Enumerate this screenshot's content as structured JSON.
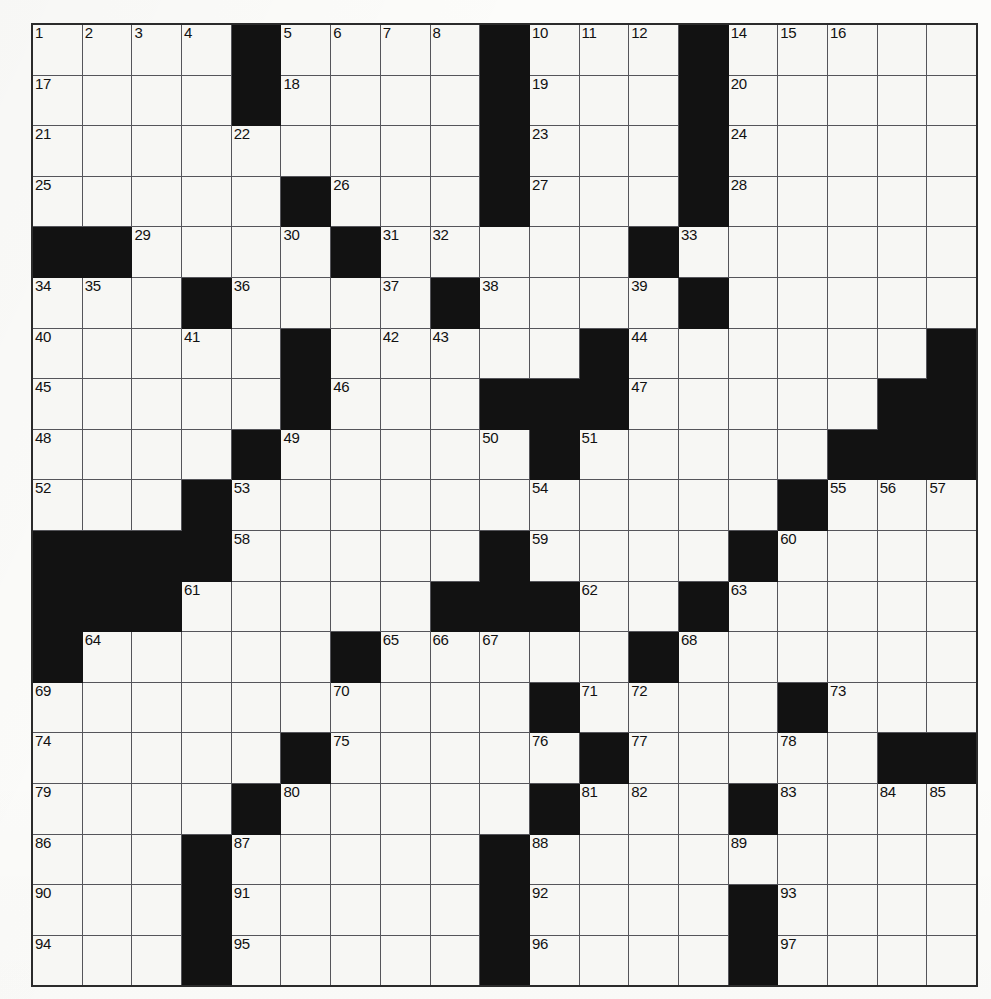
{
  "puzzle": {
    "kind": "crossword-grid",
    "rows": 19,
    "cols": 19,
    "colors": {
      "block": "#121212",
      "cell": "#f7f7f4",
      "gridline": "#55555a",
      "border": "#2b2b2b",
      "number_text": "#111111",
      "paper": "#fcfcfa"
    },
    "blocks": [
      [
        0,
        4
      ],
      [
        0,
        9
      ],
      [
        0,
        13
      ],
      [
        1,
        4
      ],
      [
        1,
        9
      ],
      [
        1,
        13
      ],
      [
        2,
        9
      ],
      [
        2,
        13
      ],
      [
        3,
        5
      ],
      [
        3,
        9
      ],
      [
        3,
        13
      ],
      [
        4,
        0
      ],
      [
        4,
        1
      ],
      [
        4,
        6
      ],
      [
        4,
        12
      ],
      [
        5,
        3
      ],
      [
        5,
        8
      ],
      [
        5,
        13
      ],
      [
        6,
        5
      ],
      [
        6,
        11
      ],
      [
        6,
        18
      ],
      [
        7,
        5
      ],
      [
        7,
        9
      ],
      [
        7,
        10
      ],
      [
        7,
        11
      ],
      [
        7,
        17
      ],
      [
        7,
        18
      ],
      [
        8,
        4
      ],
      [
        8,
        10
      ],
      [
        8,
        16
      ],
      [
        8,
        17
      ],
      [
        8,
        18
      ],
      [
        9,
        3
      ],
      [
        9,
        15
      ],
      [
        10,
        0
      ],
      [
        10,
        1
      ],
      [
        10,
        2
      ],
      [
        10,
        3
      ],
      [
        10,
        9
      ],
      [
        10,
        14
      ],
      [
        11,
        0
      ],
      [
        11,
        1
      ],
      [
        11,
        2
      ],
      [
        11,
        8
      ],
      [
        11,
        9
      ],
      [
        11,
        10
      ],
      [
        11,
        13
      ],
      [
        12,
        0
      ],
      [
        12,
        6
      ],
      [
        12,
        12
      ],
      [
        13,
        10
      ],
      [
        13,
        15
      ],
      [
        14,
        5
      ],
      [
        14,
        11
      ],
      [
        14,
        17
      ],
      [
        14,
        18
      ],
      [
        15,
        4
      ],
      [
        15,
        10
      ],
      [
        15,
        14
      ],
      [
        16,
        3
      ],
      [
        16,
        9
      ],
      [
        17,
        3
      ],
      [
        17,
        9
      ],
      [
        17,
        14
      ],
      [
        18,
        3
      ],
      [
        18,
        9
      ],
      [
        18,
        14
      ]
    ],
    "numbers": [
      {
        "r": 0,
        "c": 0,
        "n": "1"
      },
      {
        "r": 0,
        "c": 1,
        "n": "2"
      },
      {
        "r": 0,
        "c": 2,
        "n": "3"
      },
      {
        "r": 0,
        "c": 3,
        "n": "4"
      },
      {
        "r": 0,
        "c": 5,
        "n": "5"
      },
      {
        "r": 0,
        "c": 6,
        "n": "6"
      },
      {
        "r": 0,
        "c": 7,
        "n": "7"
      },
      {
        "r": 0,
        "c": 8,
        "n": "8"
      },
      {
        "r": 0,
        "c": 9,
        "n": "9"
      },
      {
        "r": 0,
        "c": 10,
        "n": "10"
      },
      {
        "r": 0,
        "c": 11,
        "n": "11"
      },
      {
        "r": 0,
        "c": 12,
        "n": "12"
      },
      {
        "r": 0,
        "c": 13,
        "n": "13"
      },
      {
        "r": 0,
        "c": 14,
        "n": "14"
      },
      {
        "r": 0,
        "c": 15,
        "n": "15"
      },
      {
        "r": 0,
        "c": 16,
        "n": "16"
      },
      {
        "r": 1,
        "c": 0,
        "n": "17"
      },
      {
        "r": 1,
        "c": 5,
        "n": "18"
      },
      {
        "r": 1,
        "c": 10,
        "n": "19"
      },
      {
        "r": 1,
        "c": 14,
        "n": "20"
      },
      {
        "r": 2,
        "c": 0,
        "n": "21"
      },
      {
        "r": 2,
        "c": 4,
        "n": "22"
      },
      {
        "r": 2,
        "c": 10,
        "n": "23"
      },
      {
        "r": 2,
        "c": 14,
        "n": "24"
      },
      {
        "r": 3,
        "c": 0,
        "n": "25"
      },
      {
        "r": 3,
        "c": 6,
        "n": "26"
      },
      {
        "r": 3,
        "c": 10,
        "n": "27"
      },
      {
        "r": 3,
        "c": 14,
        "n": "28"
      },
      {
        "r": 4,
        "c": 2,
        "n": "29"
      },
      {
        "r": 4,
        "c": 5,
        "n": "30"
      },
      {
        "r": 4,
        "c": 7,
        "n": "31"
      },
      {
        "r": 4,
        "c": 8,
        "n": "32"
      },
      {
        "r": 4,
        "c": 13,
        "n": "33"
      },
      {
        "r": 5,
        "c": 0,
        "n": "34"
      },
      {
        "r": 5,
        "c": 1,
        "n": "35"
      },
      {
        "r": 5,
        "c": 4,
        "n": "36"
      },
      {
        "r": 5,
        "c": 7,
        "n": "37"
      },
      {
        "r": 5,
        "c": 9,
        "n": "38"
      },
      {
        "r": 5,
        "c": 12,
        "n": "39"
      },
      {
        "r": 6,
        "c": 0,
        "n": "40"
      },
      {
        "r": 6,
        "c": 3,
        "n": "41"
      },
      {
        "r": 6,
        "c": 7,
        "n": "42"
      },
      {
        "r": 6,
        "c": 8,
        "n": "43"
      },
      {
        "r": 6,
        "c": 12,
        "n": "44"
      },
      {
        "r": 7,
        "c": 0,
        "n": "45"
      },
      {
        "r": 7,
        "c": 6,
        "n": "46"
      },
      {
        "r": 7,
        "c": 12,
        "n": "47"
      },
      {
        "r": 8,
        "c": 0,
        "n": "48"
      },
      {
        "r": 8,
        "c": 5,
        "n": "49"
      },
      {
        "r": 8,
        "c": 9,
        "n": "50"
      },
      {
        "r": 8,
        "c": 11,
        "n": "51"
      },
      {
        "r": 9,
        "c": 0,
        "n": "52"
      },
      {
        "r": 9,
        "c": 4,
        "n": "53"
      },
      {
        "r": 9,
        "c": 10,
        "n": "54"
      },
      {
        "r": 9,
        "c": 16,
        "n": "55"
      },
      {
        "r": 9,
        "c": 17,
        "n": "56"
      },
      {
        "r": 9,
        "c": 18,
        "n": "57"
      },
      {
        "r": 10,
        "c": 4,
        "n": "58"
      },
      {
        "r": 10,
        "c": 10,
        "n": "59"
      },
      {
        "r": 10,
        "c": 15,
        "n": "60"
      },
      {
        "r": 11,
        "c": 3,
        "n": "61"
      },
      {
        "r": 11,
        "c": 11,
        "n": "62"
      },
      {
        "r": 11,
        "c": 14,
        "n": "63"
      },
      {
        "r": 12,
        "c": 1,
        "n": "64"
      },
      {
        "r": 12,
        "c": 7,
        "n": "65"
      },
      {
        "r": 12,
        "c": 8,
        "n": "66"
      },
      {
        "r": 12,
        "c": 9,
        "n": "67"
      },
      {
        "r": 12,
        "c": 13,
        "n": "68"
      },
      {
        "r": 13,
        "c": 0,
        "n": "69"
      },
      {
        "r": 13,
        "c": 6,
        "n": "70"
      },
      {
        "r": 13,
        "c": 11,
        "n": "71"
      },
      {
        "r": 13,
        "c": 12,
        "n": "72"
      },
      {
        "r": 13,
        "c": 16,
        "n": "73"
      },
      {
        "r": 14,
        "c": 0,
        "n": "74"
      },
      {
        "r": 14,
        "c": 6,
        "n": "75"
      },
      {
        "r": 14,
        "c": 10,
        "n": "76"
      },
      {
        "r": 14,
        "c": 12,
        "n": "77"
      },
      {
        "r": 14,
        "c": 15,
        "n": "78"
      },
      {
        "r": 15,
        "c": 0,
        "n": "79"
      },
      {
        "r": 15,
        "c": 5,
        "n": "80"
      },
      {
        "r": 15,
        "c": 11,
        "n": "81"
      },
      {
        "r": 15,
        "c": 12,
        "n": "82"
      },
      {
        "r": 15,
        "c": 15,
        "n": "83"
      },
      {
        "r": 15,
        "c": 17,
        "n": "84"
      },
      {
        "r": 15,
        "c": 18,
        "n": "85"
      },
      {
        "r": 16,
        "c": 0,
        "n": "86"
      },
      {
        "r": 16,
        "c": 4,
        "n": "87"
      },
      {
        "r": 16,
        "c": 10,
        "n": "88"
      },
      {
        "r": 16,
        "c": 14,
        "n": "89"
      },
      {
        "r": 17,
        "c": 0,
        "n": "90"
      },
      {
        "r": 17,
        "c": 4,
        "n": "91"
      },
      {
        "r": 17,
        "c": 10,
        "n": "92"
      },
      {
        "r": 17,
        "c": 15,
        "n": "93"
      },
      {
        "r": 18,
        "c": 0,
        "n": "94"
      },
      {
        "r": 18,
        "c": 4,
        "n": "95"
      },
      {
        "r": 18,
        "c": 10,
        "n": "96"
      },
      {
        "r": 18,
        "c": 15,
        "n": "97"
      }
    ],
    "entries": []
  }
}
